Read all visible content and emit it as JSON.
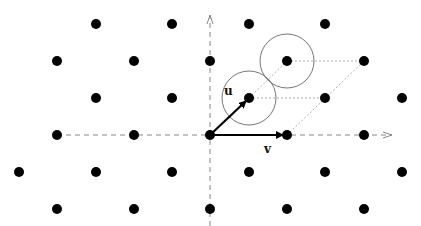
{
  "diagram": {
    "title": "",
    "labels": {
      "u": "u",
      "v": "v"
    },
    "colors": {
      "point": "#000000",
      "axis": "#888888",
      "circle": "#777777",
      "vector": "#000000",
      "guide": "#999999"
    },
    "origin": [
      210,
      135
    ],
    "vectors": [
      {
        "name": "u",
        "from": [
          210,
          135
        ],
        "to": [
          249,
          98
        ]
      },
      {
        "name": "v",
        "from": [
          210,
          135
        ],
        "to": [
          287,
          135
        ]
      }
    ],
    "circles": [
      {
        "center": [
          249,
          98
        ],
        "r": 27
      },
      {
        "center": [
          287,
          61
        ],
        "r": 27
      }
    ],
    "points": [
      [
        96,
        24
      ],
      [
        172,
        24
      ],
      [
        249,
        24
      ],
      [
        325,
        24
      ],
      [
        57,
        61
      ],
      [
        134,
        61
      ],
      [
        210,
        61
      ],
      [
        287,
        61
      ],
      [
        364,
        61
      ],
      [
        96,
        98
      ],
      [
        172,
        98
      ],
      [
        249,
        98
      ],
      [
        325,
        98
      ],
      [
        402,
        98
      ],
      [
        57,
        135
      ],
      [
        134,
        135
      ],
      [
        210,
        135
      ],
      [
        287,
        135
      ],
      [
        364,
        135
      ],
      [
        19,
        172
      ],
      [
        96,
        172
      ],
      [
        172,
        172
      ],
      [
        249,
        172
      ],
      [
        325,
        172
      ],
      [
        402,
        172
      ],
      [
        57,
        209
      ],
      [
        134,
        209
      ],
      [
        210,
        209
      ],
      [
        287,
        209
      ],
      [
        364,
        209
      ]
    ]
  }
}
